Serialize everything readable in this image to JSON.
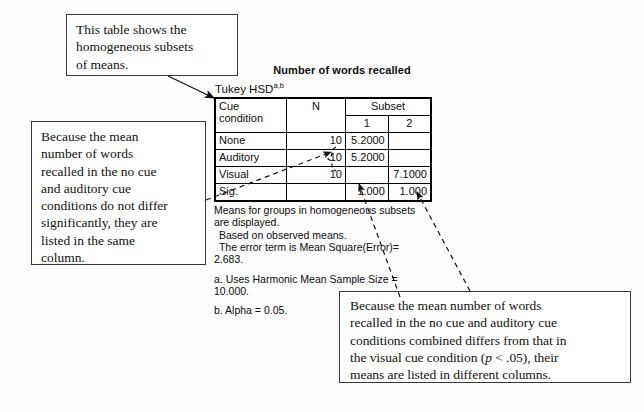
{
  "figure": {
    "kind": "spss-output-annotated-figure"
  },
  "table": {
    "title": "Number of words recalled",
    "subtitle_text": "Tukey HSD",
    "subtitle_superscript": "a,b",
    "headers": {
      "cue_condition_line1": "Cue",
      "cue_condition_line2": "condition",
      "n": "N",
      "subset_group": "Subset",
      "subset_1": "1",
      "subset_2": "2"
    },
    "rows": [
      {
        "condition": "None",
        "n": "10",
        "subset1": "5.2000",
        "subset2": ""
      },
      {
        "condition": "Auditory",
        "n": "10",
        "subset1": "5.2000",
        "subset2": ""
      },
      {
        "condition": "Visual",
        "n": "10",
        "subset1": "",
        "subset2": "7.1000"
      },
      {
        "condition": "Sig.",
        "n": "",
        "subset1": "1.000",
        "subset2": "1.000"
      }
    ],
    "notes": [
      "Means for groups in homogeneous subsets",
      "are displayed.",
      " Based on observed means.",
      " The error term is Mean Square(Error)=",
      "2.683."
    ],
    "footnotes": [
      "a. Uses Harmonic Mean Sample Size =",
      "10.000.",
      "b. Alpha = 0.05."
    ]
  },
  "callouts": {
    "top": {
      "lines": [
        "This table shows the",
        "homogeneous subsets",
        "of means."
      ]
    },
    "left": {
      "lines": [
        "Because the mean",
        "number of words",
        "recalled in the no cue",
        "and auditory cue",
        "conditions do not differ",
        "significantly, they are",
        "listed in the same",
        "column."
      ]
    },
    "bottom": {
      "line1": "Because the mean number of words",
      "line2": "recalled in the no cue and auditory cue",
      "line3": "conditions combined differs from that in",
      "line4_a": "the visual cue condition (",
      "line4_italic": "p",
      "line4_b": " < .05), their",
      "line5": "means are listed in different columns."
    }
  },
  "colors": {
    "ink": "#0d0d0d",
    "rule": "#000000",
    "page_background": "#fcfcfc",
    "callout_border": "#3a3a3a"
  }
}
